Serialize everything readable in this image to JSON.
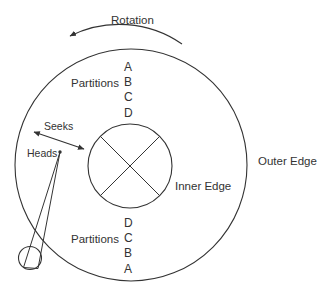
{
  "diagram": {
    "title_label": "Rotation",
    "labels": {
      "rotation": "Rotation",
      "outer_edge": "Outer Edge",
      "inner_edge": "Inner Edge",
      "seeks": "Seeks",
      "heads": "Heads",
      "partitions_top": "Partitions",
      "partitions_bottom": "Partitions"
    },
    "partitions_top_letters": [
      "A",
      "B",
      "C",
      "D"
    ],
    "partitions_bottom_letters": [
      "D",
      "C",
      "B",
      "A"
    ],
    "colors": {
      "stroke": "#333333",
      "text": "#333333",
      "background": "#ffffff"
    },
    "geometry": {
      "outer_circle": {
        "cx": 131,
        "cy": 165,
        "r": 116
      },
      "inner_circle": {
        "cx": 130,
        "cy": 166,
        "r": 42
      },
      "pivot_circle": {
        "cx": 30,
        "cy": 258,
        "r": 11
      },
      "head_tip": {
        "x": 60,
        "y": 152
      }
    },
    "arrows": {
      "rotation_direction": "counter-clockwise",
      "seeks_direction": "bidirectional"
    }
  }
}
